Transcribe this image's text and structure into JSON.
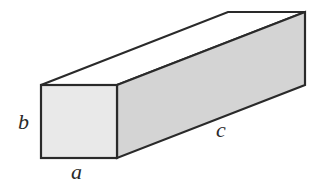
{
  "diagram": {
    "type": "rectangular-prism",
    "labels": {
      "width": "a",
      "height": "b",
      "length": "c"
    },
    "colors": {
      "front_face": "#e9e9e9",
      "side_face": "#d4d4d4",
      "top_face": "#ffffff",
      "stroke": "#2a2a2a"
    }
  }
}
